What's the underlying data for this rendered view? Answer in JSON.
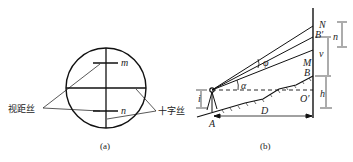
{
  "figure_a": {
    "caption": "(a)",
    "label_m": "m",
    "label_n": "n",
    "label_stadia_hairs": "视距丝",
    "label_crosshair": "十字丝"
  },
  "figure_b": {
    "caption": "(b)",
    "label_N": "N",
    "label_B_prime": "B′",
    "label_n": "n",
    "label_v": "v",
    "label_M": "M",
    "label_B": "B",
    "label_phi": "φ",
    "label_alpha": "α",
    "label_i": "i",
    "label_h": "h",
    "label_O_prime": "O′",
    "label_D": "D",
    "label_A": "A"
  }
}
